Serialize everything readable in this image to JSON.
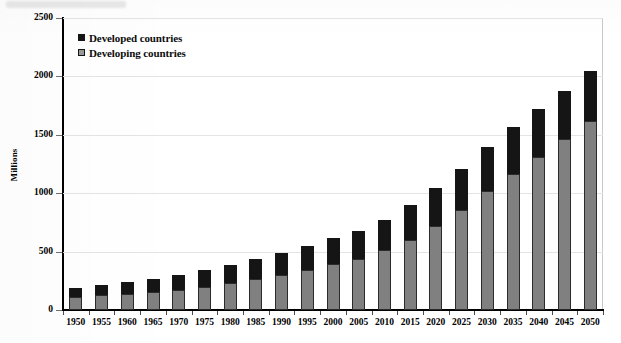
{
  "chart_data": {
    "type": "bar",
    "subtype": "stacked-vertical",
    "title": "",
    "xlabel": "",
    "ylabel": "Millions",
    "ylim": [
      0,
      2500
    ],
    "ytick_values": [
      0,
      500,
      1000,
      1500,
      2000,
      2500
    ],
    "ytick_labels": [
      "0",
      "500",
      "1000",
      "1500",
      "2000",
      "2500"
    ],
    "grid": "horizontal",
    "legend_position": "top-left-inside",
    "categories": [
      "1950",
      "1955",
      "1960",
      "1965",
      "1970",
      "1975",
      "1980",
      "1985",
      "1990",
      "1995",
      "2000",
      "2005",
      "2010",
      "2015",
      "2020",
      "2025",
      "2030",
      "2035",
      "2040",
      "2045",
      "2050"
    ],
    "series": [
      {
        "name": "Developing countries",
        "color": "#808080",
        "values": [
          110,
          125,
          140,
          155,
          175,
          200,
          230,
          265,
          300,
          345,
          390,
          440,
          510,
          600,
          715,
          855,
          1015,
          1165,
          1310,
          1460,
          1615
        ]
      },
      {
        "name": "Developed countries",
        "color": "#151515",
        "values": [
          80,
          90,
          100,
          110,
          125,
          140,
          155,
          170,
          190,
          205,
          225,
          240,
          260,
          300,
          330,
          355,
          380,
          400,
          410,
          415,
          435
        ]
      }
    ],
    "totals": [
      190,
      215,
      240,
      265,
      300,
      340,
      385,
      435,
      490,
      550,
      615,
      680,
      770,
      900,
      1045,
      1210,
      1395,
      1565,
      1720,
      1875,
      2050
    ],
    "legend": [
      {
        "label": "Developed countries",
        "swatch": "developed",
        "color": "#151515"
      },
      {
        "label": "Developing countries",
        "swatch": "developing",
        "color": "#9a9a9a"
      }
    ],
    "axis_color": "#000000",
    "grid_color": "#e4e4e4",
    "plot_border_color": "#c9c9c9"
  }
}
